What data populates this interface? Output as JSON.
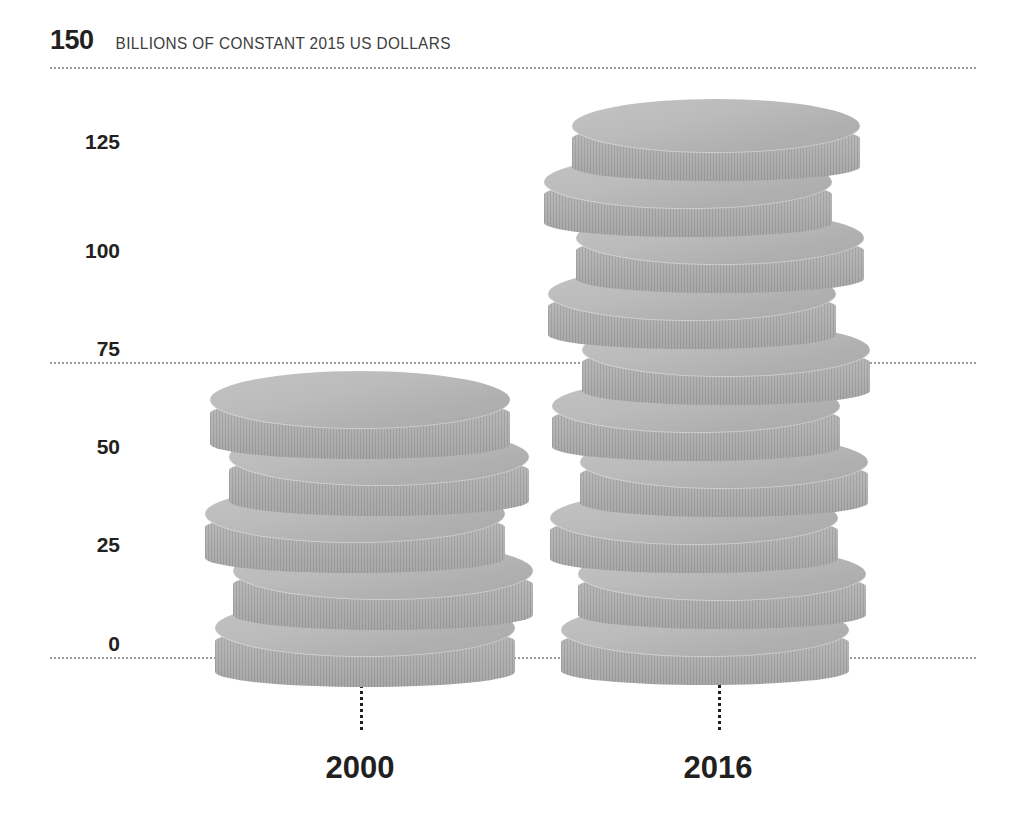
{
  "header": {
    "value": "150",
    "caption": "BILLIONS OF CONSTANT 2015 US DOLLARS"
  },
  "chart_data": {
    "type": "bar",
    "title": "150 BILLIONS OF CONSTANT 2015 US DOLLARS",
    "subtitle": "",
    "xlabel": "",
    "ylabel": "BILLIONS OF CONSTANT 2015 US DOLLARS",
    "categories": [
      "2000",
      "2016"
    ],
    "values": [
      73,
      142
    ],
    "units": "billions of constant 2015 US dollars",
    "ylim": [
      0,
      150
    ],
    "yticks": [
      0,
      25,
      50,
      75,
      100,
      125,
      150
    ],
    "ytick_labels": [
      "0",
      "25",
      "50",
      "75",
      "100",
      "125",
      "150"
    ],
    "gridlines_at": [
      0,
      75,
      150
    ],
    "grid": true,
    "legend": "none",
    "glyph": "coin-stack",
    "coin_counts": [
      5,
      10
    ],
    "series": [
      {
        "name": "Value",
        "values": [
          73,
          142
        ]
      }
    ]
  },
  "y_axis": {
    "ticks": [
      {
        "label": "150",
        "value": 150
      },
      {
        "label": "125",
        "value": 125
      },
      {
        "label": "100",
        "value": 100
      },
      {
        "label": "75",
        "value": 75
      },
      {
        "label": "50",
        "value": 50
      },
      {
        "label": "25",
        "value": 25
      },
      {
        "label": "0",
        "value": 0
      }
    ]
  },
  "x_axis": {
    "ticks": [
      {
        "label": "2000"
      },
      {
        "label": "2016"
      }
    ]
  },
  "colors": {
    "coin_top": "#bbbbbb",
    "coin_rim": "#a9a9a9",
    "grid": "#9a9a9a",
    "text": "#231f20",
    "background": "#ffffff"
  }
}
